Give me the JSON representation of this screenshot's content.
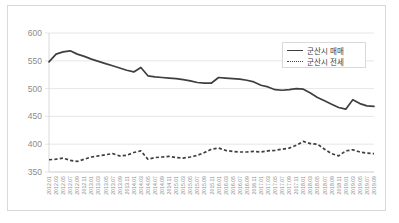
{
  "chart_data": {
    "type": "line",
    "title": "",
    "xlabel": "",
    "ylabel": "",
    "ylim": [
      350,
      600
    ],
    "ytick_step": 50,
    "yticks": [
      600,
      550,
      500,
      450,
      400,
      350
    ],
    "grid": true,
    "legend_position": "top-right",
    "categories": [
      "2012.01",
      "2012.03",
      "2012.05",
      "2012.07",
      "2012.09",
      "2012.11",
      "2013.01",
      "2013.03",
      "2013.05",
      "2013.07",
      "2013.09",
      "2013.11",
      "2014.01",
      "2014.03",
      "2014.05",
      "2014.07",
      "2014.09",
      "2014.11",
      "2015.01",
      "2015.03",
      "2015.05",
      "2015.07",
      "2015.09",
      "2015.11",
      "2016.01",
      "2016.03",
      "2016.05",
      "2016.07",
      "2016.09",
      "2016.11",
      "2017.01",
      "2017.03",
      "2017.05",
      "2017.07",
      "2017.09",
      "2017.11",
      "2018.01",
      "2018.03",
      "2018.05",
      "2018.07",
      "2018.09",
      "2018.11",
      "2019.01",
      "2019.03",
      "2019.05",
      "2019.07",
      "2019.09"
    ],
    "series": [
      {
        "name": "군산시 매매",
        "style": "solid",
        "color": "#3f3f3f",
        "values": [
          548,
          562,
          566,
          568,
          562,
          558,
          553,
          549,
          545,
          541,
          537,
          533,
          530,
          538,
          523,
          521,
          520,
          519,
          518,
          516,
          514,
          511,
          510,
          510,
          520,
          519,
          518,
          517,
          515,
          512,
          506,
          503,
          498,
          497,
          498,
          500,
          499,
          492,
          484,
          478,
          472,
          466,
          463,
          480,
          473,
          469,
          468
        ]
      },
      {
        "name": "군산시 전세",
        "style": "dashed",
        "color": "#3f3f3f",
        "values": [
          372,
          373,
          375,
          371,
          369,
          373,
          377,
          379,
          381,
          383,
          379,
          380,
          385,
          388,
          373,
          376,
          377,
          378,
          376,
          375,
          377,
          380,
          385,
          391,
          393,
          389,
          387,
          386,
          386,
          387,
          386,
          388,
          389,
          391,
          393,
          398,
          405,
          401,
          400,
          391,
          383,
          379,
          388,
          390,
          386,
          384,
          383
        ]
      }
    ]
  },
  "legend": {
    "items": [
      {
        "label": "군산시 매매",
        "style": "solid"
      },
      {
        "label": "군산시 전세",
        "style": "dashed"
      }
    ]
  }
}
